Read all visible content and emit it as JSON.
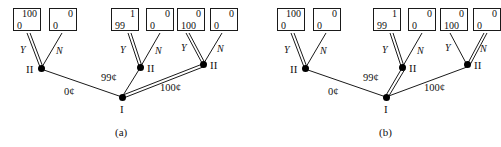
{
  "figure": {
    "kind": "game-tree-diagram",
    "panels": [
      {
        "id": "a",
        "caption": "(a)",
        "root": {
          "label": "I",
          "name": "player-one-node"
        },
        "decision_nodes": [
          {
            "id": "left",
            "label": "II",
            "label_side": "left"
          },
          {
            "id": "middle",
            "label": "II",
            "label_side": "right"
          },
          {
            "id": "right",
            "label": "II",
            "label_side": "right"
          }
        ],
        "root_branches": [
          {
            "id": "b0",
            "label": "0¢",
            "highlighted": false
          },
          {
            "id": "b99",
            "label": "99¢",
            "highlighted": false
          },
          {
            "id": "b100",
            "label": "100¢",
            "highlighted": true
          }
        ],
        "node_branches": [
          {
            "node": "left",
            "yes": "Y",
            "no": "N",
            "highlighted": "Y"
          },
          {
            "node": "middle",
            "yes": "Y",
            "no": "N",
            "highlighted": "Y"
          },
          {
            "node": "right",
            "yes": "Y",
            "no": "N",
            "highlighted": "Y"
          }
        ],
        "payoffs": [
          {
            "id": "p1",
            "top": "100",
            "bottom": "0"
          },
          {
            "id": "p2",
            "top": "0",
            "bottom": "0"
          },
          {
            "id": "p3",
            "top": "1",
            "bottom": "99"
          },
          {
            "id": "p4",
            "top": "0",
            "bottom": "0"
          },
          {
            "id": "p5",
            "top": "0",
            "bottom": "100"
          },
          {
            "id": "p6",
            "top": "0",
            "bottom": "0"
          }
        ]
      },
      {
        "id": "b",
        "caption": "(b)",
        "root": {
          "label": "I",
          "name": "player-one-node"
        },
        "decision_nodes": [
          {
            "id": "left",
            "label": "II",
            "label_side": "left"
          },
          {
            "id": "middle",
            "label": "II",
            "label_side": "right"
          },
          {
            "id": "right",
            "label": "II",
            "label_side": "right"
          }
        ],
        "root_branches": [
          {
            "id": "b0",
            "label": "0¢",
            "highlighted": false
          },
          {
            "id": "b99",
            "label": "99¢",
            "highlighted": true
          },
          {
            "id": "b100",
            "label": "100¢",
            "highlighted": false
          }
        ],
        "node_branches": [
          {
            "node": "left",
            "yes": "Y",
            "no": "N",
            "highlighted": "Y"
          },
          {
            "node": "middle",
            "yes": "Y",
            "no": "N",
            "highlighted": "Y"
          },
          {
            "node": "right",
            "yes": "Y",
            "no": "N",
            "highlighted": "N"
          }
        ],
        "payoffs": [
          {
            "id": "p1",
            "top": "100",
            "bottom": "0"
          },
          {
            "id": "p2",
            "top": "0",
            "bottom": "0"
          },
          {
            "id": "p3",
            "top": "1",
            "bottom": "99"
          },
          {
            "id": "p4",
            "top": "0",
            "bottom": "0"
          },
          {
            "id": "p5",
            "top": "0",
            "bottom": "100"
          },
          {
            "id": "p6",
            "top": "0",
            "bottom": "0"
          }
        ]
      }
    ],
    "colors": {
      "line": "#1a1a1a",
      "node": "#000000",
      "background": "#ffffff"
    }
  }
}
